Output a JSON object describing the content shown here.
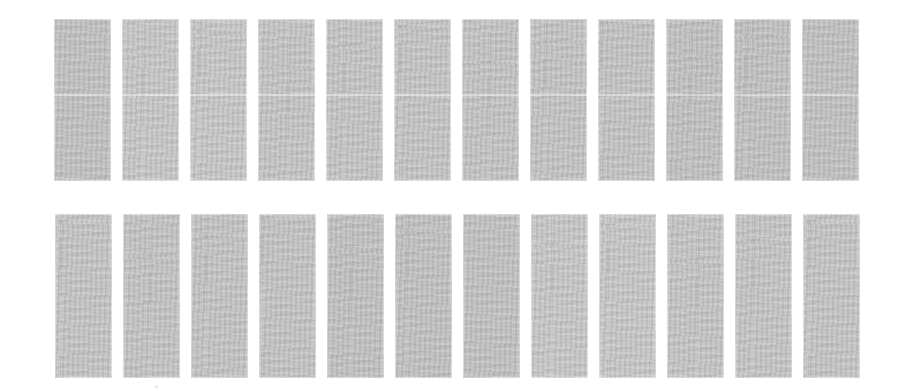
{
  "sheet": {
    "title": "Scanned contact sheet",
    "background_color": "#ffffff",
    "width": 911,
    "height": 391,
    "frame_color": "#c2c2c2",
    "frame_count_total": 24,
    "row_count": 2,
    "columns_per_row": 12
  },
  "rows": [
    {
      "name": "top-row",
      "label": "Top row of frames",
      "frame_count": 12,
      "top": 19,
      "height": 162,
      "left": 54,
      "frame_width": 57,
      "pitch": 68,
      "has_seam": true,
      "seam_offset": 75,
      "frames": [
        {
          "index": 1,
          "label": "Frame 1"
        },
        {
          "index": 2,
          "label": "Frame 2"
        },
        {
          "index": 3,
          "label": "Frame 3"
        },
        {
          "index": 4,
          "label": "Frame 4"
        },
        {
          "index": 5,
          "label": "Frame 5"
        },
        {
          "index": 6,
          "label": "Frame 6"
        },
        {
          "index": 7,
          "label": "Frame 7"
        },
        {
          "index": 8,
          "label": "Frame 8"
        },
        {
          "index": 9,
          "label": "Frame 9"
        },
        {
          "index": 10,
          "label": "Frame 10"
        },
        {
          "index": 11,
          "label": "Frame 11"
        },
        {
          "index": 12,
          "label": "Frame 12"
        }
      ]
    },
    {
      "name": "bottom-row",
      "label": "Bottom row of frames",
      "frame_count": 12,
      "top": 214,
      "height": 164,
      "left": 55,
      "frame_width": 57,
      "pitch": 68,
      "has_seam": false,
      "seam_offset": 0,
      "frames": [
        {
          "index": 1,
          "label": "Frame 13"
        },
        {
          "index": 2,
          "label": "Frame 14"
        },
        {
          "index": 3,
          "label": "Frame 15"
        },
        {
          "index": 4,
          "label": "Frame 16"
        },
        {
          "index": 5,
          "label": "Frame 17"
        },
        {
          "index": 6,
          "label": "Frame 18"
        },
        {
          "index": 7,
          "label": "Frame 19"
        },
        {
          "index": 8,
          "label": "Frame 20"
        },
        {
          "index": 9,
          "label": "Frame 21"
        },
        {
          "index": 10,
          "label": "Frame 22"
        },
        {
          "index": 11,
          "label": "Frame 23"
        },
        {
          "index": 12,
          "label": "Frame 24"
        }
      ]
    }
  ],
  "artifacts": [
    {
      "name": "speck",
      "x": 155,
      "y": 385,
      "size": 3
    }
  ]
}
